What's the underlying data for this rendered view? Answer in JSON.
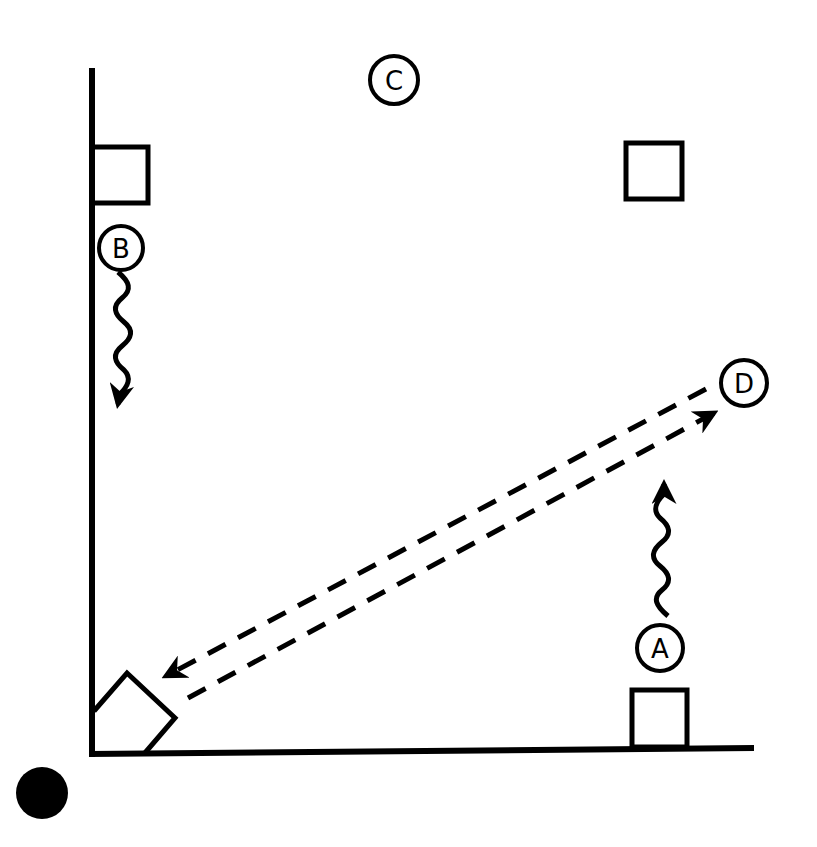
{
  "diagram": {
    "type": "court-play-diagram",
    "colors": {
      "ink": "#000000",
      "background": "#ffffff"
    },
    "markers": [
      {
        "id": "A",
        "label": "A",
        "kind": "player"
      },
      {
        "id": "B",
        "label": "B",
        "kind": "player"
      },
      {
        "id": "C",
        "label": "C",
        "kind": "player"
      },
      {
        "id": "D",
        "label": "D",
        "kind": "player"
      }
    ],
    "cones": [
      {
        "id": "top-left",
        "shape": "square"
      },
      {
        "id": "top-right",
        "shape": "square"
      },
      {
        "id": "bottom-right",
        "shape": "square"
      },
      {
        "id": "bottom-left",
        "shape": "rotated-square"
      }
    ],
    "ball": {
      "shape": "filled-circle"
    },
    "movements": [
      {
        "from": "B",
        "style": "wavy-arrow",
        "direction": "down"
      },
      {
        "from": "A",
        "style": "wavy-arrow",
        "direction": "up"
      }
    ],
    "passes": [
      {
        "from": "bottom-left",
        "to": "D",
        "style": "dashed-arrow"
      },
      {
        "from": "D",
        "to": "bottom-left",
        "style": "dashed-arrow"
      }
    ]
  }
}
